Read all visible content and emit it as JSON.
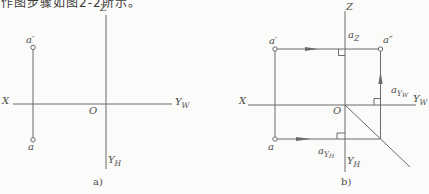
{
  "page": {
    "background": "#fbfbf9",
    "line_color": "#6a6a6a",
    "text_color": "#4c4c4c"
  },
  "caption_top": {
    "text": "作图步骤如图2-2所示。"
  },
  "diagram_a": {
    "caption": "a)",
    "axis_labels": {
      "z": "Z",
      "x": "X",
      "origin": "O",
      "yw_base": "Y",
      "yw_sub": "W",
      "yh_base": "Y",
      "yh_sub": "H"
    },
    "point_labels": {
      "a_front": "a′",
      "a_top": "a"
    }
  },
  "diagram_b": {
    "caption": "b)",
    "axis_labels": {
      "z": "Z",
      "x": "X",
      "origin": "O",
      "yw_base": "Y",
      "yw_sub": "W",
      "yh_base": "Y",
      "yh_sub": "H"
    },
    "point_labels": {
      "a_front": "a′",
      "a_top": "a",
      "a_profile": "a″",
      "az_base": "a",
      "az_sub": "Z",
      "ayw_base": "a",
      "ayw_sub": "Y",
      "ayw_subsub": "W",
      "ayh_base": "a",
      "ayh_sub": "Y",
      "ayh_subsub": "H"
    }
  }
}
